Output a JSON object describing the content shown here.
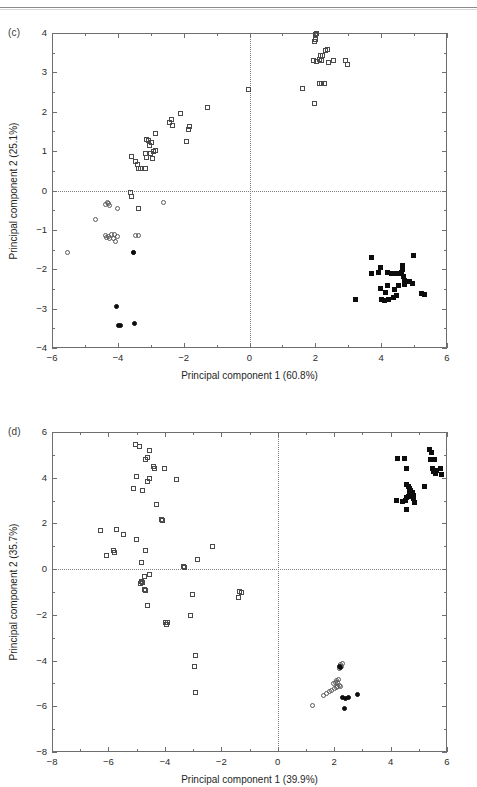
{
  "page": {
    "header_rule": "horizontal-rule",
    "background": "#ffffff",
    "ink": "#1a1a1a"
  },
  "chart_data": [
    {
      "id": "panel-c",
      "type": "scatter",
      "panel_label": "(c)",
      "title": "",
      "xlabel": "Principal component 1 (60.8%)",
      "ylabel": "Principal component 2 (25.1%)",
      "xlim": [
        -6,
        6
      ],
      "ylim": [
        -4,
        4
      ],
      "xticks": [
        -6,
        -4,
        -2,
        0,
        2,
        4,
        6
      ],
      "yticks": [
        -4,
        -3,
        -2,
        -1,
        0,
        1,
        2,
        3,
        4
      ],
      "xticklabels": [
        "−6",
        "−4",
        "−2",
        "0",
        "2",
        "4",
        "6"
      ],
      "yticklabels": [
        "−4",
        "−3",
        "−2",
        "−1",
        "0",
        "1",
        "2",
        "3",
        "4"
      ],
      "minor_xticks": [
        -5,
        -3,
        -1,
        1,
        3,
        5
      ],
      "minor_yticks": [
        -3.5,
        -2.5,
        -1.5,
        -0.5,
        0.5,
        1.5,
        2.5,
        3.5
      ],
      "grid": false,
      "zero_lines": {
        "x": 0,
        "y": 0,
        "style": "dotted"
      },
      "legend": null,
      "marker_colors": {
        "open-square": "#4a4a4a",
        "filled-square": "#0d0d0d",
        "open-circle": "#5a5a5a",
        "filled-circle": "#0d0d0d"
      },
      "series": [
        {
          "name": "open-square",
          "marker": "open-square",
          "points": [
            [
              -3.63,
              -0.05
            ],
            [
              -3.6,
              -0.14
            ],
            [
              -3.36,
              -0.46
            ],
            [
              -3.37,
              0.56
            ],
            [
              -3.3,
              0.57
            ],
            [
              -3.4,
              0.66
            ],
            [
              -3.45,
              0.73
            ],
            [
              -3.6,
              0.86
            ],
            [
              -3.16,
              0.56
            ],
            [
              -3.12,
              0.83
            ],
            [
              -3.15,
              0.95
            ],
            [
              -3.02,
              0.94
            ],
            [
              -2.92,
              1.0
            ],
            [
              -2.86,
              1.02
            ],
            [
              -2.94,
              0.82
            ],
            [
              -3.05,
              1.14
            ],
            [
              -2.98,
              1.22
            ],
            [
              -3.07,
              1.26
            ],
            [
              -3.12,
              1.3
            ],
            [
              -2.85,
              1.44
            ],
            [
              -2.42,
              1.73
            ],
            [
              -2.38,
              1.81
            ],
            [
              -2.35,
              1.64
            ],
            [
              -2.1,
              1.95
            ],
            [
              -1.85,
              1.56
            ],
            [
              -1.82,
              1.63
            ],
            [
              -1.9,
              1.24
            ],
            [
              -1.28,
              2.12
            ],
            [
              -0.02,
              2.57
            ],
            [
              1.6,
              2.59
            ],
            [
              1.98,
              2.2
            ],
            [
              2.12,
              2.71
            ],
            [
              2.2,
              2.72
            ],
            [
              2.28,
              2.72
            ],
            [
              1.95,
              3.3
            ],
            [
              2.05,
              3.28
            ],
            [
              2.12,
              3.32
            ],
            [
              2.2,
              3.3
            ],
            [
              2.15,
              3.42
            ],
            [
              2.22,
              3.44
            ],
            [
              2.4,
              3.26
            ],
            [
              2.55,
              3.3
            ],
            [
              2.3,
              3.56
            ],
            [
              2.38,
              3.58
            ],
            [
              1.98,
              3.78
            ],
            [
              2.02,
              3.84
            ],
            [
              2.0,
              3.95
            ],
            [
              2.05,
              3.98
            ],
            [
              2.92,
              3.3
            ],
            [
              2.98,
              3.2
            ]
          ]
        },
        {
          "name": "open-circle",
          "marker": "open-circle",
          "points": [
            [
              -5.52,
              -1.58
            ],
            [
              -4.68,
              -0.74
            ],
            [
              -4.32,
              -0.31
            ],
            [
              -4.28,
              -0.34
            ],
            [
              -4.36,
              -0.36
            ],
            [
              -4.24,
              -0.38
            ],
            [
              -4.02,
              -0.45
            ],
            [
              -3.53,
              -1.57
            ],
            [
              -4.38,
              -1.14
            ],
            [
              -4.33,
              -1.19
            ],
            [
              -4.28,
              -1.16
            ],
            [
              -4.24,
              -1.22
            ],
            [
              -4.2,
              -1.13
            ],
            [
              -4.1,
              -1.11
            ],
            [
              -4.14,
              -1.21
            ],
            [
              -4.06,
              -1.3
            ],
            [
              -4.02,
              -1.17
            ],
            [
              -3.45,
              -1.15
            ],
            [
              -3.38,
              -1.15
            ],
            [
              -2.6,
              -0.31
            ]
          ]
        },
        {
          "name": "filled-circle",
          "marker": "filled-circle",
          "points": [
            [
              -4.05,
              -2.94
            ],
            [
              -3.92,
              -3.42
            ],
            [
              -3.98,
              -3.44
            ],
            [
              -3.48,
              -3.38
            ],
            [
              -3.52,
              -1.57
            ]
          ]
        },
        {
          "name": "filled-square",
          "marker": "filled-square",
          "points": [
            [
              3.22,
              -2.76
            ],
            [
              3.7,
              -1.7
            ],
            [
              3.7,
              -2.1
            ],
            [
              3.92,
              -2.08
            ],
            [
              3.98,
              -1.95
            ],
            [
              4.18,
              -2.08
            ],
            [
              4.3,
              -2.1
            ],
            [
              4.42,
              -2.12
            ],
            [
              4.52,
              -2.12
            ],
            [
              4.62,
              -2.08
            ],
            [
              4.64,
              -2.0
            ],
            [
              4.66,
              -1.9
            ],
            [
              4.68,
              -2.18
            ],
            [
              4.7,
              -2.28
            ],
            [
              4.72,
              -2.38
            ],
            [
              4.74,
              -2.3
            ],
            [
              4.86,
              -2.32
            ],
            [
              4.96,
              -2.35
            ],
            [
              4.98,
              -1.64
            ],
            [
              4.2,
              -2.42
            ],
            [
              4.12,
              -2.6
            ],
            [
              4.02,
              -2.78
            ],
            [
              4.1,
              -2.8
            ],
            [
              4.22,
              -2.76
            ],
            [
              4.36,
              -2.72
            ],
            [
              4.48,
              -2.66
            ],
            [
              4.4,
              -2.52
            ],
            [
              4.52,
              -2.42
            ],
            [
              3.98,
              -2.5
            ],
            [
              5.22,
              -2.62
            ],
            [
              5.32,
              -2.64
            ]
          ]
        }
      ]
    },
    {
      "id": "panel-d",
      "type": "scatter",
      "panel_label": "(d)",
      "title": "",
      "xlabel": "Principal component 1 (39.9%)",
      "ylabel": "Principal component 2 (35.7%)",
      "xlim": [
        -8,
        6
      ],
      "ylim": [
        -8,
        6
      ],
      "xticks": [
        -8,
        -6,
        -4,
        -2,
        0,
        2,
        4,
        6
      ],
      "yticks": [
        -8,
        -6,
        -4,
        -2,
        0,
        2,
        4,
        6
      ],
      "xticklabels": [
        "−8",
        "−6",
        "−4",
        "−2",
        "0",
        "2",
        "4",
        "6"
      ],
      "yticklabels": [
        "−8",
        "−6",
        "−4",
        "−2",
        "0",
        "2",
        "4",
        "6"
      ],
      "minor_xticks": [
        -7,
        -5,
        -3,
        -1,
        1,
        3,
        5
      ],
      "minor_yticks": [
        -7,
        -5,
        -3,
        -1,
        1,
        3,
        5
      ],
      "grid": false,
      "zero_lines": {
        "x": 0,
        "y": 0,
        "style": "dotted"
      },
      "legend": null,
      "marker_colors": {
        "open-square": "#4a4a4a",
        "filled-square": "#0d0d0d",
        "open-circle": "#5a5a5a",
        "filled-circle": "#0d0d0d"
      },
      "series": [
        {
          "name": "open-square",
          "marker": "open-square",
          "points": [
            [
              -5.05,
              5.45
            ],
            [
              -4.9,
              5.38
            ],
            [
              -4.55,
              5.18
            ],
            [
              -4.62,
              4.88
            ],
            [
              -4.7,
              4.8
            ],
            [
              -4.4,
              4.48
            ],
            [
              -4.38,
              4.4
            ],
            [
              -4.02,
              4.4
            ],
            [
              -5.02,
              4.05
            ],
            [
              -4.55,
              3.98
            ],
            [
              -4.62,
              3.82
            ],
            [
              -3.58,
              3.92
            ],
            [
              -5.12,
              3.52
            ],
            [
              -4.78,
              3.42
            ],
            [
              -4.28,
              2.85
            ],
            [
              -4.12,
              2.18
            ],
            [
              -4.1,
              2.12
            ],
            [
              -6.28,
              1.7
            ],
            [
              -5.72,
              1.75
            ],
            [
              -5.48,
              1.52
            ],
            [
              -5.02,
              1.28
            ],
            [
              -5.82,
              0.82
            ],
            [
              -5.8,
              0.75
            ],
            [
              -6.08,
              0.6
            ],
            [
              -4.68,
              0.82
            ],
            [
              -4.82,
              0.3
            ],
            [
              -2.85,
              0.42
            ],
            [
              -2.32,
              1.0
            ],
            [
              -3.35,
              0.12
            ],
            [
              -3.32,
              0.08
            ],
            [
              -4.55,
              -0.22
            ],
            [
              -4.72,
              -0.3
            ],
            [
              -4.82,
              -0.55
            ],
            [
              -4.78,
              -0.6
            ],
            [
              -4.88,
              -0.62
            ],
            [
              -4.72,
              -0.88
            ],
            [
              -4.7,
              -0.92
            ],
            [
              -4.62,
              -1.58
            ],
            [
              -3.02,
              -1.12
            ],
            [
              -1.35,
              -0.98
            ],
            [
              -1.3,
              -1.02
            ],
            [
              -1.38,
              -1.25
            ],
            [
              -3.08,
              -2.02
            ],
            [
              -3.98,
              -2.35
            ],
            [
              -3.9,
              -2.32
            ],
            [
              -3.95,
              -2.42
            ],
            [
              -2.92,
              -3.78
            ],
            [
              -2.95,
              -4.28
            ],
            [
              -2.92,
              -5.38
            ]
          ]
        },
        {
          "name": "open-circle",
          "marker": "open-circle",
          "points": [
            [
              1.22,
              -5.98
            ],
            [
              1.62,
              -5.52
            ],
            [
              1.72,
              -5.42
            ],
            [
              1.82,
              -5.35
            ],
            [
              1.92,
              -5.3
            ],
            [
              2.0,
              -5.22
            ],
            [
              2.08,
              -5.18
            ],
            [
              2.12,
              -5.12
            ],
            [
              1.98,
              -5.02
            ],
            [
              2.05,
              -4.98
            ],
            [
              2.12,
              -4.95
            ],
            [
              2.18,
              -5.08
            ],
            [
              2.22,
              -5.12
            ],
            [
              2.08,
              -4.88
            ],
            [
              2.15,
              -4.82
            ],
            [
              2.2,
              -4.35
            ],
            [
              2.25,
              -4.28
            ],
            [
              2.22,
              -4.18
            ],
            [
              2.28,
              -4.12
            ]
          ]
        },
        {
          "name": "filled-circle",
          "marker": "filled-circle",
          "points": [
            [
              2.3,
              -5.62
            ],
            [
              2.42,
              -5.68
            ],
            [
              2.52,
              -5.6
            ],
            [
              2.82,
              -5.48
            ],
            [
              2.35,
              -6.08
            ],
            [
              2.22,
              -4.32
            ],
            [
              2.18,
              -4.25
            ]
          ]
        },
        {
          "name": "filled-square",
          "marker": "filled-square",
          "points": [
            [
              4.2,
              3.02
            ],
            [
              4.42,
              2.98
            ],
            [
              4.52,
              3.02
            ],
            [
              4.58,
              2.62
            ],
            [
              4.55,
              3.12
            ],
            [
              4.62,
              3.18
            ],
            [
              4.68,
              3.3
            ],
            [
              4.72,
              3.42
            ],
            [
              4.78,
              3.35
            ],
            [
              4.8,
              3.22
            ],
            [
              4.82,
              3.1
            ],
            [
              4.85,
              2.92
            ],
            [
              4.68,
              3.55
            ],
            [
              4.62,
              3.62
            ],
            [
              4.55,
              3.72
            ],
            [
              4.48,
              4.82
            ],
            [
              4.55,
              4.42
            ],
            [
              4.25,
              4.82
            ],
            [
              5.38,
              5.22
            ],
            [
              5.45,
              5.12
            ],
            [
              5.42,
              4.78
            ],
            [
              5.55,
              4.78
            ],
            [
              5.48,
              4.42
            ],
            [
              5.52,
              4.28
            ],
            [
              5.58,
              4.18
            ],
            [
              5.62,
              4.32
            ],
            [
              5.22,
              3.62
            ],
            [
              5.78,
              4.42
            ],
            [
              5.82,
              4.12
            ]
          ]
        }
      ]
    }
  ]
}
